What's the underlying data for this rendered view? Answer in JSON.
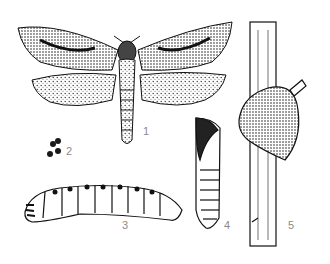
{
  "figure": {
    "background": "#ffffff",
    "ink_color": "#1a1a1a",
    "label_color": "#8a8a8a",
    "labels": [
      {
        "id": "1",
        "text": "1",
        "subject": "adult moth"
      },
      {
        "id": "2",
        "text": "2",
        "subject": "eggs"
      },
      {
        "id": "3",
        "text": "3",
        "subject": "larva"
      },
      {
        "id": "4",
        "text": "4",
        "subject": "pupa"
      },
      {
        "id": "5",
        "text": "5",
        "subject": "plant stem with damage"
      }
    ]
  }
}
